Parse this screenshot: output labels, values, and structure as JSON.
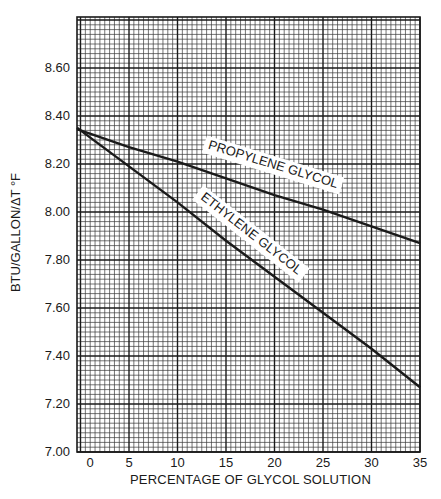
{
  "chart_data": {
    "type": "line",
    "title": "",
    "xlabel": "PERCENTAGE OF GLYCOL SOLUTION",
    "ylabel": "BTU/GALLON/ΔT °F",
    "xlim": [
      -0.4,
      35
    ],
    "ylim": [
      7.0,
      8.81
    ],
    "x_ticks": [
      "0",
      "5",
      "10",
      "15",
      "20",
      "25",
      "30",
      "35"
    ],
    "y_ticks": [
      "7.00",
      "7.20",
      "7.40",
      "7.60",
      "7.80",
      "8.00",
      "8.20",
      "8.40",
      "8.60"
    ],
    "grid": {
      "on": true,
      "major_x_step": 5,
      "minor_x_step": 0.5,
      "major_y_step": 0.2,
      "minor_y_step": 0.02
    },
    "legend": "inline labels on lines",
    "x": [
      0,
      5,
      10,
      15,
      20,
      25,
      30,
      35
    ],
    "series": [
      {
        "name": "PROPYLENE GLYCOL",
        "values": [
          8.34,
          8.27,
          8.21,
          8.14,
          8.07,
          8.01,
          7.94,
          7.87
        ]
      },
      {
        "name": "ETHYLENE GLYCOL",
        "values": [
          8.34,
          8.19,
          8.04,
          7.88,
          7.73,
          7.58,
          7.43,
          7.27
        ]
      }
    ]
  },
  "labels": {
    "propylene": "PROPYLENE GLYCOL",
    "ethylene": "ETHYLENE GLYCOL"
  }
}
